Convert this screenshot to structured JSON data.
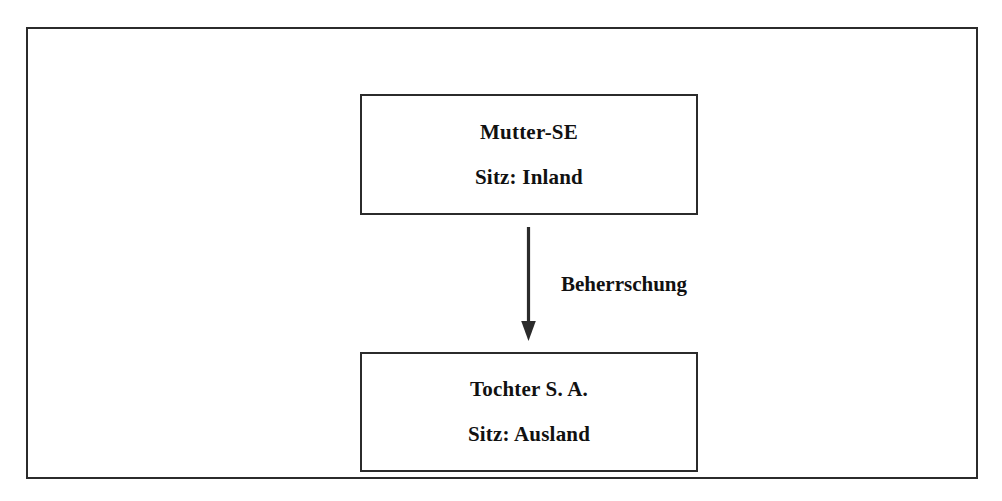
{
  "diagram": {
    "background_color": "#ffffff",
    "line_color": "#2b2b2b",
    "text_color": "#111111",
    "nodes": [
      {
        "id": "parent",
        "role": "parent-company",
        "line_1": "Mutter-SE",
        "line_2": "Sitz: Inland"
      },
      {
        "id": "subsidiary",
        "role": "subsidiary-company",
        "line_1": "Tochter S. A.",
        "line_2": "Sitz: Ausland"
      }
    ],
    "edges": [
      {
        "id": "control",
        "from": "parent",
        "to": "subsidiary",
        "label": "Beherrschung",
        "direction": "down",
        "style": "solid-arrow"
      }
    ]
  }
}
